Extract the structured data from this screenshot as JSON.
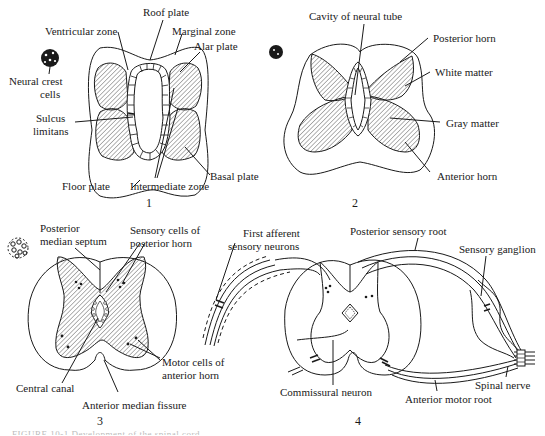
{
  "figure": {
    "panels": [
      {
        "id": 1,
        "number": "1",
        "labels": {
          "roof_plate": "Roof plate",
          "ventricular_zone": "Ventricular zone",
          "marginal_zone": "Marginal zone",
          "alar_plate": "Alar plate",
          "neural_crest_cells_1": "Neural crest",
          "neural_crest_cells_2": "cells",
          "sulcus_limitans_1": "Sulcus",
          "sulcus_limitans_2": "limitans",
          "basal_plate": "Basal plate",
          "floor_plate": "Floor plate",
          "intermediate_zone": "Intermediate zone"
        }
      },
      {
        "id": 2,
        "number": "2",
        "labels": {
          "cavity_of_neural_tube": "Cavity of neural tube",
          "posterior_horn": "Posterior horn",
          "white_matter": "White matter",
          "gray_matter": "Gray matter",
          "anterior_horn": "Anterior horn"
        }
      },
      {
        "id": 3,
        "number": "3",
        "labels": {
          "posterior_median_septum_1": "Posterior",
          "posterior_median_septum_2": "median septum",
          "sensory_cells_1": "Sensory cells of",
          "sensory_cells_2": "posterior horn",
          "motor_cells_1": "Motor cells of",
          "motor_cells_2": "anterior horn",
          "central_canal": "Central canal",
          "anterior_median_fissure": "Anterior median fissure"
        }
      },
      {
        "id": 4,
        "number": "4",
        "labels": {
          "first_afferent_1": "First afferent",
          "first_afferent_2": "sensory neurons",
          "posterior_sensory_root": "Posterior sensory root",
          "sensory_ganglion": "Sensory ganglion",
          "commissural_neuron": "Commissural neuron",
          "spinal_nerve": "Spinal nerve",
          "anterior_motor_root": "Anterior motor root"
        }
      }
    ],
    "caption": "FIGURE 10-1  Development of the spinal cord"
  },
  "colors": {
    "line": "#1a1a1a",
    "hatch": "#555555",
    "background": "#ffffff"
  }
}
